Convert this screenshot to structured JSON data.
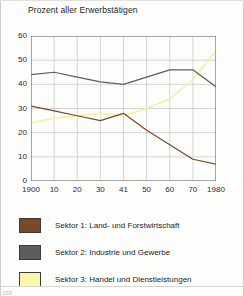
{
  "chart_data": {
    "type": "line",
    "title": "Prozent aller Erwerbstätigen",
    "xlabel": "",
    "ylabel": "",
    "ylim": [
      0,
      60
    ],
    "yticks": [
      0,
      10,
      20,
      30,
      40,
      50,
      60
    ],
    "grid": true,
    "legend_position": "bottom",
    "categories": [
      "1900",
      "10",
      "20",
      "30",
      "41",
      "50",
      "60",
      "70",
      "1980"
    ],
    "x_values": [
      1900,
      1910,
      1920,
      1930,
      1941,
      1950,
      1960,
      1970,
      1980
    ],
    "series": [
      {
        "name": "Sektor 1: Land- und Forstwirtschaft",
        "color": "#7a4a28",
        "values": [
          31,
          29,
          27,
          25,
          28,
          21,
          15,
          9,
          7
        ]
      },
      {
        "name": "Sektor 2: Industrie und Gewerbe",
        "color": "#5d5d5a",
        "values": [
          44,
          45,
          43,
          41,
          40,
          43,
          46,
          46,
          39
        ]
      },
      {
        "name": "Sektor 3: Handel und Dienstleistungen",
        "color": "#f3f09a",
        "values": [
          24,
          26,
          27,
          28,
          27,
          30,
          34,
          42,
          54
        ]
      }
    ]
  },
  "legend": {
    "items": [
      {
        "label": "Sektor 1: Land- und Forstwirtschaft",
        "color": "#7a4a28"
      },
      {
        "label": "Sektor 2: Industrie und Gewerbe",
        "color": "#5d5d5a"
      },
      {
        "label": "Sektor 3: Handel und Dienstleistungen",
        "color": "#fbf6a8"
      }
    ]
  },
  "footer": {
    "page_number": "159"
  }
}
